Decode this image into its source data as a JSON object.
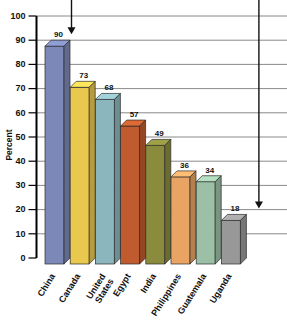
{
  "chart_data": {
    "type": "bar",
    "title": "",
    "subtitle": "",
    "xlabel": "",
    "ylabel": "Percent",
    "ylim": [
      0,
      100
    ],
    "ytick_step": 10,
    "yticks": [
      0,
      10,
      20,
      30,
      40,
      50,
      60,
      70,
      80,
      90,
      100
    ],
    "grid": true,
    "grid_axis": "y",
    "legend": false,
    "legend_position": "none",
    "style": "3d-bars",
    "categories": [
      "China",
      "Canada",
      "United States",
      "Egypt",
      "India",
      "Philippines",
      "Guatemala",
      "Uganda"
    ],
    "category_label_lines": [
      [
        "China"
      ],
      [
        "Canada"
      ],
      [
        "United",
        "States"
      ],
      [
        "Egypt"
      ],
      [
        "India"
      ],
      [
        "Philippines"
      ],
      [
        "Guatemala"
      ],
      [
        "Uganda"
      ]
    ],
    "values": [
      90,
      73,
      68,
      57,
      49,
      36,
      34,
      18
    ],
    "value_labels": [
      "90",
      "73",
      "68",
      "57",
      "49",
      "36",
      "34",
      "18"
    ],
    "bar_colors": [
      "#7b88b8",
      "#e9c84e",
      "#8cb6bd",
      "#bf5b2e",
      "#8a8b3c",
      "#e9a463",
      "#9cc0a6",
      "#989898"
    ],
    "annotations": [
      {
        "name": "arrow-to-china-value",
        "kind": "down-arrow",
        "target_category": "China",
        "target_value": 90
      },
      {
        "name": "arrow-to-uganda-value",
        "kind": "down-arrow",
        "target_category": "Uganda",
        "target_value": 18
      }
    ]
  }
}
